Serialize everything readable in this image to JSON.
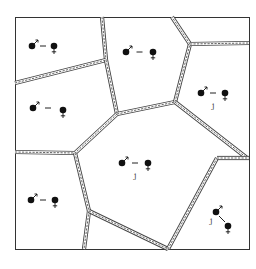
{
  "diagram": {
    "type": "territory-map",
    "frame": {
      "x": 15,
      "y": 17,
      "w": 234,
      "h": 232
    },
    "boundaries": [
      [
        [
          102,
          17
        ],
        [
          106,
          60
        ]
      ],
      [
        [
          15,
          83
        ],
        [
          106,
          60
        ]
      ],
      [
        [
          106,
          60
        ],
        [
          117,
          114
        ]
      ],
      [
        [
          117,
          114
        ],
        [
          175,
          102
        ]
      ],
      [
        [
          175,
          102
        ],
        [
          190,
          44
        ]
      ],
      [
        [
          190,
          44
        ],
        [
          172,
          17
        ]
      ],
      [
        [
          190,
          44
        ],
        [
          249,
          43
        ]
      ],
      [
        [
          175,
          102
        ],
        [
          247,
          158
        ]
      ],
      [
        [
          117,
          114
        ],
        [
          75,
          153
        ]
      ],
      [
        [
          15,
          152
        ],
        [
          75,
          153
        ]
      ],
      [
        [
          75,
          153
        ],
        [
          89,
          211
        ]
      ],
      [
        [
          89,
          211
        ],
        [
          84,
          249
        ]
      ],
      [
        [
          89,
          211
        ],
        [
          168,
          249
        ]
      ],
      [
        [
          168,
          249
        ],
        [
          217,
          158
        ]
      ],
      [
        [
          217,
          158
        ],
        [
          249,
          158
        ]
      ]
    ],
    "pairs": [
      {
        "id": "pair-1",
        "male": [
          32,
          46
        ],
        "female": [
          54,
          46
        ],
        "link": "dash",
        "label": ""
      },
      {
        "id": "pair-2",
        "male": [
          33,
          108
        ],
        "female": [
          63,
          110
        ],
        "link": "dash",
        "label": ""
      },
      {
        "id": "pair-3",
        "male": [
          126,
          52
        ],
        "female": [
          153,
          52
        ],
        "link": "dash",
        "label": ""
      },
      {
        "id": "pair-4",
        "male": [
          201,
          93
        ],
        "female": [
          225,
          93
        ],
        "link": "dash",
        "label": "j"
      },
      {
        "id": "pair-5",
        "male": [
          122,
          163
        ],
        "female": [
          148,
          163
        ],
        "link": "dash",
        "label": "j"
      },
      {
        "id": "pair-6",
        "male": [
          31,
          200
        ],
        "female": [
          55,
          200
        ],
        "link": "dash",
        "label": ""
      },
      {
        "id": "pair-7",
        "male": [
          216,
          212
        ],
        "female": [
          228,
          226
        ],
        "link": "diag",
        "label": "j"
      }
    ],
    "legend": {
      "male_symbol": "♂",
      "female_symbol": "♀",
      "link_symbol": "–"
    },
    "colors": {
      "ink": "#111111",
      "boundary": "#444444",
      "background": "#ffffff"
    }
  }
}
